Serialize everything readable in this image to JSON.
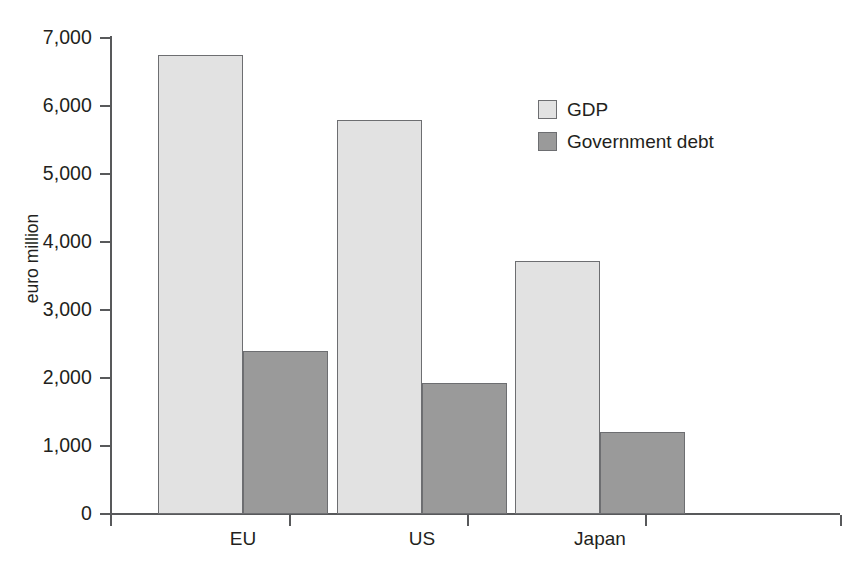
{
  "chart_data": {
    "type": "bar",
    "title": "",
    "subtitle": "",
    "xlabel": "",
    "ylabel": "euro million",
    "categories": [
      "EU",
      "US",
      "Japan"
    ],
    "series": [
      {
        "name": "GDP",
        "values": [
          6750,
          5800,
          3720
        ],
        "color": "#e2e2e2"
      },
      {
        "name": "Government debt",
        "values": [
          2400,
          1920,
          1210
        ],
        "color": "#9a9a9a"
      }
    ],
    "ylim": [
      0,
      7000
    ],
    "yticks": [
      0,
      1000,
      2000,
      3000,
      4000,
      5000,
      6000,
      7000
    ],
    "ytick_labels": [
      "0",
      "1,000",
      "2,000",
      "3,000",
      "4,000",
      "5,000",
      "6,000",
      "7,000"
    ],
    "grid": false,
    "legend_position": "top-right",
    "bar_border_color": "#6d6e71",
    "axis_color": "#58595b",
    "background": "#ffffff"
  }
}
